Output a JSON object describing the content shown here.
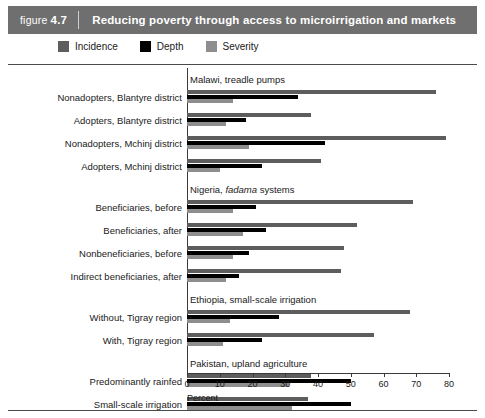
{
  "banner": {
    "figure_prefix": "figure",
    "figure_number": "4.7",
    "title": "Reducing poverty through access to microirrigation and markets"
  },
  "legend": {
    "position": "top-left",
    "items": [
      {
        "label": "Incidence",
        "color": "#5d5d5d"
      },
      {
        "label": "Depth",
        "color": "#000000"
      },
      {
        "label": "Severity",
        "color": "#8e8e8e"
      }
    ]
  },
  "axis": {
    "x_title": "Percent",
    "x_ticks": [
      "0",
      "10",
      "20",
      "30",
      "40",
      "50",
      "60",
      "70",
      "80"
    ],
    "x_min": 0,
    "x_max": 80
  },
  "chart_data": {
    "type": "bar",
    "orientation": "horizontal",
    "title": "Reducing poverty through access to microirrigation and markets",
    "xlabel": "Percent",
    "ylabel": "",
    "xlim": [
      0,
      80
    ],
    "grid": false,
    "legend_position": "top-left",
    "series_names": [
      "Incidence",
      "Depth",
      "Severity"
    ],
    "series_colors": [
      "#5d5d5d",
      "#000000",
      "#8e8e8e"
    ],
    "groups": [
      {
        "name": "Malawi, treadle pumps",
        "name_italic": "",
        "categories": [
          {
            "label": "Nonadopters, Blantyre district",
            "Incidence": 76,
            "Depth": 34,
            "Severity": 14
          },
          {
            "label": "Adopters, Blantyre district",
            "Incidence": 38,
            "Depth": 18,
            "Severity": 12
          },
          {
            "label": "Nonadopters, Mchinj district",
            "Incidence": 79,
            "Depth": 42,
            "Severity": 19
          },
          {
            "label": "Adopters, Mchinj district",
            "Incidence": 41,
            "Depth": 23,
            "Severity": 10
          }
        ]
      },
      {
        "name": "Nigeria, fadama systems",
        "name_italic": "fadama",
        "categories": [
          {
            "label": "Beneficiaries, before",
            "Incidence": 69,
            "Depth": 21,
            "Severity": 14
          },
          {
            "label": "Beneficiaries, after",
            "Incidence": 52,
            "Depth": 24,
            "Severity": 17
          },
          {
            "label": "Nonbeneficiaries, before",
            "Incidence": 48,
            "Depth": 19,
            "Severity": 14
          },
          {
            "label": "Indirect beneficiaries, after",
            "Incidence": 47,
            "Depth": 16,
            "Severity": 12
          }
        ]
      },
      {
        "name": "Ethiopia, small-scale irrigation",
        "name_italic": "",
        "categories": [
          {
            "label": "Without, Tigray region",
            "Incidence": 68,
            "Depth": 28,
            "Severity": 13
          },
          {
            "label": "With, Tigray region",
            "Incidence": 57,
            "Depth": 23,
            "Severity": 11
          }
        ]
      },
      {
        "name": "Pakistan, upland agriculture",
        "name_italic": "",
        "categories": [
          {
            "label": "Predominantly rainfed",
            "Incidence": 38,
            "Depth": 50,
            "Severity": 31
          },
          {
            "label": "Small-scale irrigation",
            "Incidence": 37,
            "Depth": 50,
            "Severity": 32
          }
        ]
      }
    ]
  }
}
